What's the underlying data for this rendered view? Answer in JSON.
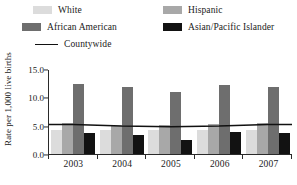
{
  "chart_data": {
    "type": "bar",
    "title": "",
    "xlabel": "",
    "ylabel": "Rate per 1,000 live births",
    "categories": [
      "2003",
      "2004",
      "2005",
      "2006",
      "2007"
    ],
    "ylim": [
      0.0,
      15.0
    ],
    "yticks": [
      "0.0",
      "5.0",
      "10.0",
      "15.0"
    ],
    "ytick_values": [
      0.0,
      5.0,
      10.0,
      15.0
    ],
    "grid": false,
    "legend_position": "top",
    "series": [
      {
        "name": "White",
        "type": "bar",
        "color": "#dcdcdc",
        "values": [
          4.3,
          4.2,
          4.3,
          4.2,
          4.3
        ]
      },
      {
        "name": "Hispanic",
        "type": "bar",
        "color": "#a8a8a8",
        "values": [
          5.5,
          5.0,
          5.2,
          5.3,
          5.5
        ]
      },
      {
        "name": "African American",
        "type": "bar",
        "color": "#6e6e6e",
        "values": [
          12.4,
          11.8,
          10.9,
          12.2,
          11.8
        ]
      },
      {
        "name": "Asian/Pacific Islander",
        "type": "bar",
        "color": "#121212",
        "values": [
          3.7,
          3.3,
          2.5,
          3.8,
          3.7
        ]
      },
      {
        "name": "Countywide",
        "type": "line",
        "color": "#111111",
        "values": [
          5.4,
          5.1,
          5.0,
          5.1,
          5.4
        ]
      }
    ]
  },
  "legend": {
    "items": [
      {
        "label": "White",
        "swatch": "legend-swatch-white",
        "color": "#dcdcdc",
        "kind": "bar"
      },
      {
        "label": "Hispanic",
        "swatch": "legend-swatch-hispanic",
        "color": "#a8a8a8",
        "kind": "bar"
      },
      {
        "label": "African American",
        "swatch": "legend-swatch-african",
        "color": "#6e6e6e",
        "kind": "bar"
      },
      {
        "label": "Asian/Pacific Islander",
        "swatch": "legend-swatch-asian",
        "color": "#121212",
        "kind": "bar"
      },
      {
        "label": "Countywide",
        "swatch": "legend-swatch-line",
        "color": "#111111",
        "kind": "line"
      }
    ]
  },
  "axis": {
    "y_title": "Rate per 1,000 live births",
    "y_labels": [
      "15.0",
      "10.0",
      "5.0",
      "0.0"
    ],
    "x_labels": [
      "2003",
      "2004",
      "2005",
      "2006",
      "2007"
    ]
  }
}
